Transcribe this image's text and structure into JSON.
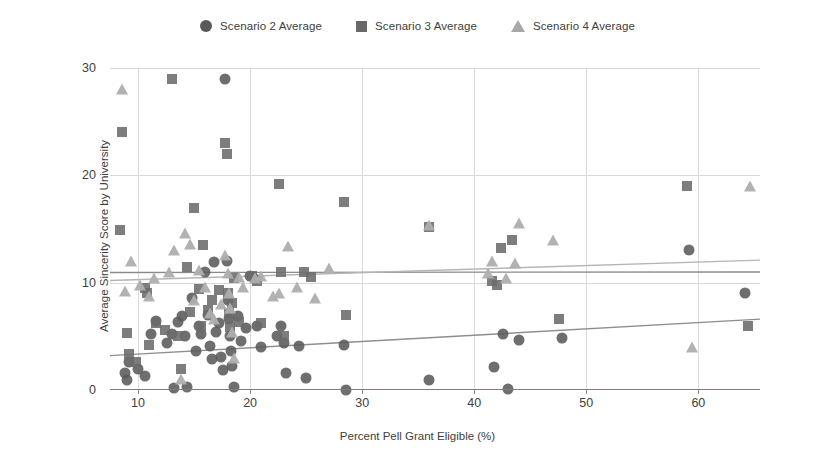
{
  "chart_data": {
    "type": "scatter",
    "title": "",
    "xlabel": "Percent Pell Grant Eligible (%)",
    "ylabel": "Average Sincerity Score by University",
    "xlim": [
      7.5,
      65.5
    ],
    "ylim": [
      0,
      30
    ],
    "xticks": [
      10,
      20,
      30,
      40,
      50,
      60
    ],
    "yticks": [
      0,
      10,
      20,
      30
    ],
    "grid": true,
    "legend_position": "top-center",
    "colors": {
      "scenario2": "#5a5a5a",
      "scenario3": "#6b6b6b",
      "scenario4": "#aeaeae",
      "grid": "#d8d8d8",
      "axis": "#7d7d7d"
    },
    "legend": [
      {
        "label": "Scenario 2 Average",
        "marker": "circle",
        "color": "#595959"
      },
      {
        "label": "Scenario 3 Average",
        "marker": "square",
        "color": "#686868"
      },
      {
        "label": "Scenario 4 Average",
        "marker": "triangle",
        "color": "#a8a8a8"
      }
    ],
    "series": [
      {
        "name": "Scenario 2 Average",
        "marker": "circle",
        "color": "#5a5a5a",
        "points": [
          [
            8.8,
            1.6
          ],
          [
            9.0,
            0.9
          ],
          [
            9.2,
            2.6
          ],
          [
            10.0,
            2.0
          ],
          [
            10.6,
            1.3
          ],
          [
            11.2,
            5.2
          ],
          [
            11.6,
            6.4
          ],
          [
            12.6,
            4.4
          ],
          [
            13.0,
            5.2
          ],
          [
            13.2,
            0.2
          ],
          [
            13.6,
            6.3
          ],
          [
            13.9,
            6.9
          ],
          [
            14.2,
            5.0
          ],
          [
            14.4,
            0.3
          ],
          [
            14.8,
            8.6
          ],
          [
            15.2,
            3.6
          ],
          [
            15.4,
            6.0
          ],
          [
            15.6,
            5.2
          ],
          [
            16.0,
            11.0
          ],
          [
            16.2,
            7.0
          ],
          [
            16.4,
            4.1
          ],
          [
            16.6,
            2.9
          ],
          [
            16.8,
            11.9
          ],
          [
            17.0,
            5.4
          ],
          [
            17.2,
            6.2
          ],
          [
            17.4,
            3.1
          ],
          [
            17.6,
            1.9
          ],
          [
            17.8,
            29.0
          ],
          [
            17.9,
            12.0
          ],
          [
            18.0,
            8.4
          ],
          [
            18.1,
            6.6
          ],
          [
            18.2,
            5.0
          ],
          [
            18.3,
            3.6
          ],
          [
            18.4,
            2.2
          ],
          [
            18.6,
            0.3
          ],
          [
            18.9,
            6.9
          ],
          [
            19.2,
            4.6
          ],
          [
            19.6,
            5.8
          ],
          [
            20.0,
            10.6
          ],
          [
            20.4,
            10.3
          ],
          [
            20.6,
            6.0
          ],
          [
            21.0,
            4.0
          ],
          [
            22.4,
            5.0
          ],
          [
            22.8,
            6.0
          ],
          [
            23.0,
            4.4
          ],
          [
            23.2,
            1.6
          ],
          [
            24.4,
            4.1
          ],
          [
            25.0,
            1.1
          ],
          [
            28.4,
            4.2
          ],
          [
            28.6,
            0.0
          ],
          [
            36.0,
            0.9
          ],
          [
            41.8,
            2.1
          ],
          [
            42.6,
            5.2
          ],
          [
            43.0,
            0.1
          ],
          [
            44.0,
            4.7
          ],
          [
            47.8,
            4.8
          ],
          [
            59.2,
            13.0
          ],
          [
            64.2,
            9.0
          ]
        ]
      },
      {
        "name": "Scenario 3 Average",
        "marker": "square",
        "color": "#6b6b6b",
        "points": [
          [
            8.4,
            14.9
          ],
          [
            8.6,
            24.0
          ],
          [
            9.0,
            5.3
          ],
          [
            9.2,
            3.4
          ],
          [
            9.8,
            2.6
          ],
          [
            10.6,
            9.5
          ],
          [
            10.8,
            9.0
          ],
          [
            11.0,
            4.2
          ],
          [
            11.6,
            6.2
          ],
          [
            12.4,
            5.6
          ],
          [
            13.0,
            29.0
          ],
          [
            13.6,
            5.0
          ],
          [
            13.8,
            2.0
          ],
          [
            14.4,
            11.5
          ],
          [
            14.6,
            7.3
          ],
          [
            15.0,
            17.0
          ],
          [
            15.4,
            9.4
          ],
          [
            15.6,
            6.0
          ],
          [
            15.8,
            13.5
          ],
          [
            16.2,
            7.5
          ],
          [
            16.6,
            8.4
          ],
          [
            17.2,
            9.3
          ],
          [
            17.8,
            23.0
          ],
          [
            17.9,
            22.0
          ],
          [
            18.0,
            9.0
          ],
          [
            18.1,
            7.2
          ],
          [
            18.2,
            5.9
          ],
          [
            18.4,
            8.1
          ],
          [
            18.6,
            10.4
          ],
          [
            19.0,
            6.3
          ],
          [
            20.2,
            10.6
          ],
          [
            20.6,
            10.2
          ],
          [
            21.0,
            6.2
          ],
          [
            22.6,
            19.2
          ],
          [
            22.8,
            11.0
          ],
          [
            23.0,
            5.0
          ],
          [
            24.8,
            11.0
          ],
          [
            25.4,
            10.5
          ],
          [
            28.4,
            17.5
          ],
          [
            28.6,
            7.0
          ],
          [
            36.0,
            15.2
          ],
          [
            41.6,
            10.2
          ],
          [
            42.0,
            9.8
          ],
          [
            42.4,
            13.2
          ],
          [
            43.4,
            14.0
          ],
          [
            47.6,
            6.6
          ],
          [
            59.0,
            19.0
          ],
          [
            64.4,
            6.0
          ]
        ]
      },
      {
        "name": "Scenario 4 Average",
        "marker": "triangle",
        "color": "#aeaeae",
        "points": [
          [
            8.6,
            28.0
          ],
          [
            8.8,
            9.2
          ],
          [
            9.4,
            12.0
          ],
          [
            10.2,
            9.8
          ],
          [
            11.0,
            8.8
          ],
          [
            11.4,
            10.4
          ],
          [
            12.8,
            11.0
          ],
          [
            13.2,
            13.0
          ],
          [
            13.8,
            1.0
          ],
          [
            14.2,
            14.6
          ],
          [
            14.6,
            13.6
          ],
          [
            15.0,
            8.4
          ],
          [
            15.4,
            11.2
          ],
          [
            16.0,
            9.6
          ],
          [
            16.4,
            7.2
          ],
          [
            16.8,
            6.6
          ],
          [
            17.4,
            8.0
          ],
          [
            17.8,
            12.6
          ],
          [
            18.0,
            10.9
          ],
          [
            18.1,
            9.0
          ],
          [
            18.2,
            7.6
          ],
          [
            18.4,
            5.4
          ],
          [
            18.6,
            3.0
          ],
          [
            19.0,
            10.5
          ],
          [
            19.4,
            9.6
          ],
          [
            20.4,
            10.4
          ],
          [
            21.0,
            10.6
          ],
          [
            22.0,
            8.8
          ],
          [
            22.6,
            9.0
          ],
          [
            23.4,
            13.4
          ],
          [
            24.2,
            9.6
          ],
          [
            25.8,
            8.6
          ],
          [
            27.0,
            11.4
          ],
          [
            36.0,
            15.4
          ],
          [
            41.2,
            10.9
          ],
          [
            41.6,
            12.0
          ],
          [
            42.8,
            10.4
          ],
          [
            43.6,
            11.8
          ],
          [
            44.0,
            15.6
          ],
          [
            47.0,
            14.0
          ],
          [
            59.4,
            4.0
          ],
          [
            64.6,
            19.0
          ]
        ]
      }
    ],
    "trendlines": [
      {
        "name": "Scenario 3 trend",
        "color": "#8a8a8a",
        "x0": 7.5,
        "y0": 10.95,
        "x1": 65.5,
        "y1": 11.0
      },
      {
        "name": "Scenario 4 trend",
        "color": "#b5b5b5",
        "x0": 7.5,
        "y0": 10.2,
        "x1": 65.5,
        "y1": 12.1
      },
      {
        "name": "Scenario 2 trend",
        "color": "#8f8f8f",
        "x0": 7.5,
        "y0": 3.2,
        "x1": 65.5,
        "y1": 6.6
      }
    ]
  }
}
